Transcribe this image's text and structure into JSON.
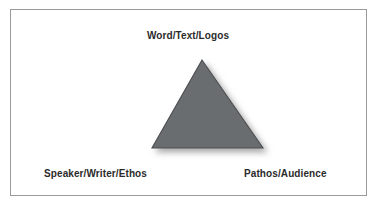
{
  "diagram": {
    "type": "rhetorical-triangle",
    "frame": {
      "border_color": "#9a9a9a",
      "background_color": "#ffffff"
    },
    "shape": {
      "name": "triangle",
      "fill_color": "#6b6d70",
      "stroke_color": "#4a4c4f",
      "shadow_color": "#b4b4b4",
      "apex": {
        "x": 202,
        "y": 60
      },
      "base_left": {
        "x": 152,
        "y": 148
      },
      "base_right": {
        "x": 263,
        "y": 148
      }
    },
    "labels": {
      "top": "Word/Text/Logos",
      "bottom_left": "Speaker/Writer/Ethos",
      "bottom_right": "Pathos/Audience"
    },
    "text_color": "#2b2b2b"
  }
}
